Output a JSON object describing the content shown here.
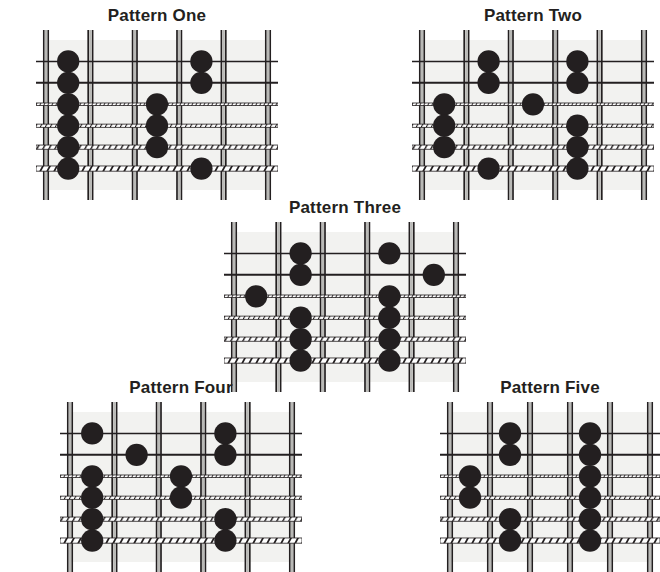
{
  "page": {
    "background_color": "#ffffff",
    "ink_color": "#231f20",
    "dot_color": "#231f20",
    "board_fill": "#f2f2f0",
    "width": 660,
    "height": 565
  },
  "diagram_spec": {
    "instrument": "guitar-fretboard",
    "string_count": 6,
    "fret_space_count": 5,
    "fret_line_count": 6,
    "string_labels_top_to_bottom": [
      "1st",
      "2nd",
      "3rd",
      "4th",
      "5th",
      "6th"
    ],
    "string_textures_top_to_bottom": [
      "plain",
      "plain",
      "fine-wound",
      "medium-wound",
      "coarse-wound",
      "coarsest-wound"
    ],
    "string_thickness_top_to_bottom": [
      1.6,
      2.0,
      2.6,
      3.2,
      4.2,
      5.2
    ]
  },
  "patterns": [
    {
      "id": "pattern-one",
      "title": "Pattern One",
      "left": 36,
      "top": 6,
      "board_width": 222,
      "board_height": 150,
      "dots": [
        {
          "string": 1,
          "fret": 1
        },
        {
          "string": 2,
          "fret": 1
        },
        {
          "string": 3,
          "fret": 1
        },
        {
          "string": 4,
          "fret": 1
        },
        {
          "string": 5,
          "fret": 1
        },
        {
          "string": 6,
          "fret": 1
        },
        {
          "string": 3,
          "fret": 3
        },
        {
          "string": 4,
          "fret": 3
        },
        {
          "string": 5,
          "fret": 3
        },
        {
          "string": 1,
          "fret": 4
        },
        {
          "string": 2,
          "fret": 4
        },
        {
          "string": 6,
          "fret": 4
        }
      ]
    },
    {
      "id": "pattern-two",
      "title": "Pattern Two",
      "left": 412,
      "top": 6,
      "board_width": 222,
      "board_height": 150,
      "dots": [
        {
          "string": 3,
          "fret": 1
        },
        {
          "string": 4,
          "fret": 1
        },
        {
          "string": 5,
          "fret": 1
        },
        {
          "string": 1,
          "fret": 2
        },
        {
          "string": 2,
          "fret": 2
        },
        {
          "string": 6,
          "fret": 2
        },
        {
          "string": 3,
          "fret": 3
        },
        {
          "string": 1,
          "fret": 4
        },
        {
          "string": 2,
          "fret": 4
        },
        {
          "string": 4,
          "fret": 4
        },
        {
          "string": 5,
          "fret": 4
        },
        {
          "string": 6,
          "fret": 4
        }
      ]
    },
    {
      "id": "pattern-three",
      "title": "Pattern Three",
      "left": 224,
      "top": 198,
      "board_width": 222,
      "board_height": 150,
      "dots": [
        {
          "string": 3,
          "fret": 1
        },
        {
          "string": 1,
          "fret": 2
        },
        {
          "string": 2,
          "fret": 2
        },
        {
          "string": 4,
          "fret": 2
        },
        {
          "string": 5,
          "fret": 2
        },
        {
          "string": 6,
          "fret": 2
        },
        {
          "string": 1,
          "fret": 4
        },
        {
          "string": 3,
          "fret": 4
        },
        {
          "string": 4,
          "fret": 4
        },
        {
          "string": 5,
          "fret": 4
        },
        {
          "string": 6,
          "fret": 4
        },
        {
          "string": 2,
          "fret": 5
        }
      ]
    },
    {
      "id": "pattern-four",
      "title": "Pattern Four",
      "left": 60,
      "top": 378,
      "board_width": 222,
      "board_height": 150,
      "dots": [
        {
          "string": 1,
          "fret": 1
        },
        {
          "string": 3,
          "fret": 1
        },
        {
          "string": 4,
          "fret": 1
        },
        {
          "string": 5,
          "fret": 1
        },
        {
          "string": 6,
          "fret": 1
        },
        {
          "string": 2,
          "fret": 2
        },
        {
          "string": 3,
          "fret": 3
        },
        {
          "string": 4,
          "fret": 3
        },
        {
          "string": 1,
          "fret": 4
        },
        {
          "string": 2,
          "fret": 4
        },
        {
          "string": 5,
          "fret": 4
        },
        {
          "string": 6,
          "fret": 4
        }
      ]
    },
    {
      "id": "pattern-five",
      "title": "Pattern Five",
      "left": 440,
      "top": 378,
      "board_width": 200,
      "board_height": 150,
      "dots": [
        {
          "string": 3,
          "fret": 1
        },
        {
          "string": 4,
          "fret": 1
        },
        {
          "string": 1,
          "fret": 2
        },
        {
          "string": 2,
          "fret": 2
        },
        {
          "string": 5,
          "fret": 2
        },
        {
          "string": 6,
          "fret": 2
        },
        {
          "string": 1,
          "fret": 4
        },
        {
          "string": 2,
          "fret": 4
        },
        {
          "string": 3,
          "fret": 4
        },
        {
          "string": 4,
          "fret": 4
        },
        {
          "string": 5,
          "fret": 4
        },
        {
          "string": 6,
          "fret": 4
        }
      ]
    }
  ]
}
